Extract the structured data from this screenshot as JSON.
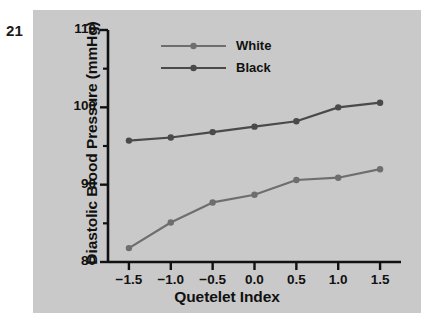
{
  "figure": {
    "number": "21"
  },
  "chart_data": {
    "type": "line",
    "title": "",
    "xlabel": "Quetelet Index",
    "ylabel": "Diastolic Blood Pressure (mmHg)",
    "x": [
      -1.5,
      -1.0,
      -0.5,
      0.0,
      0.5,
      1.0,
      1.5
    ],
    "xtick_labels": [
      "−1.5",
      "−1.0",
      "−0.5",
      "0.0",
      "0.5",
      "1.0",
      "1.5"
    ],
    "ytick_labels": [
      "80",
      "90",
      "100",
      "110"
    ],
    "yticks": [
      80,
      90,
      100,
      110
    ],
    "yminor_ticks": [
      85,
      95,
      105
    ],
    "xlim": [
      -1.75,
      1.75
    ],
    "ylim": [
      80,
      110
    ],
    "grid": false,
    "legend_position": "top-center",
    "series": [
      {
        "name": "White",
        "color": "#6e6e6e",
        "values": [
          81.8,
          85.1,
          87.7,
          88.7,
          90.6,
          90.9,
          92.0
        ]
      },
      {
        "name": "Black",
        "color": "#4a4a4a",
        "values": [
          95.7,
          96.1,
          96.8,
          97.5,
          98.2,
          100.0,
          100.6
        ]
      }
    ]
  },
  "legend": {
    "entries": [
      {
        "label": "White"
      },
      {
        "label": "Black"
      }
    ]
  },
  "colors": {
    "panel_background": "#c9c9c9",
    "axis": "#111111",
    "white_series": "#6e6e6e",
    "black_series": "#4a4a4a"
  }
}
